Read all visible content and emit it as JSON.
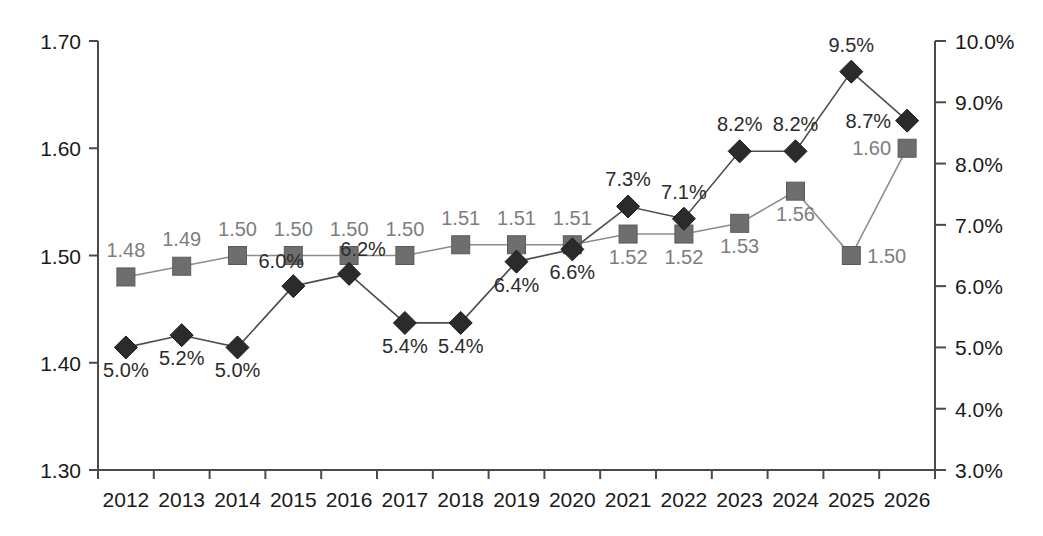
{
  "chart_data": {
    "type": "line",
    "title": "",
    "subtitle": "",
    "xlabel": "",
    "ylabel": "",
    "grid": false,
    "legend_position": "none",
    "categories": [
      "2012",
      "2013",
      "2014",
      "2015",
      "2016",
      "2017",
      "2018",
      "2019",
      "2020",
      "2021",
      "2022",
      "2023",
      "2024",
      "2025",
      "2026"
    ],
    "axes": {
      "left": {
        "ylim": [
          1.3,
          1.7
        ],
        "tick_step": 0.1,
        "tick_labels": [
          "1.70",
          "1.60",
          "1.50",
          "1.40",
          "1.30"
        ],
        "tick_values": [
          1.7,
          1.6,
          1.5,
          1.4,
          1.3
        ]
      },
      "right": {
        "ylim": [
          3.0,
          10.0
        ],
        "tick_step": 1.0,
        "tick_labels": [
          "10.0%",
          "9.0%",
          "8.0%",
          "7.0%",
          "6.0%",
          "5.0%",
          "4.0%",
          "3.0%"
        ],
        "tick_values": [
          10.0,
          9.0,
          8.0,
          7.0,
          6.0,
          5.0,
          4.0,
          3.0
        ]
      }
    },
    "series": [
      {
        "name": "value-series",
        "marker": "square",
        "axis": "left",
        "color": "#6e6e6e",
        "label_color": "#7d7d7d",
        "values": [
          1.48,
          1.49,
          1.5,
          1.5,
          1.5,
          1.5,
          1.51,
          1.51,
          1.51,
          1.52,
          1.52,
          1.53,
          1.56,
          1.5,
          1.6
        ],
        "labels": [
          "1.48",
          "1.49",
          "1.50",
          "1.50",
          "1.50",
          "1.50",
          "1.51",
          "1.51",
          "1.51",
          "1.52",
          "1.52",
          "1.53",
          "1.56",
          "1.50",
          "1.60"
        ],
        "label_positions": [
          "above",
          "above",
          "above",
          "above",
          "above",
          "above",
          "above",
          "above",
          "above",
          "below",
          "below",
          "below",
          "below",
          "right",
          "left"
        ]
      },
      {
        "name": "percent-series",
        "marker": "diamond",
        "axis": "right",
        "color": "#2b2b2b",
        "label_color": "#2b2b2b",
        "values": [
          5.0,
          5.2,
          5.0,
          6.0,
          6.2,
          5.4,
          5.4,
          6.4,
          6.6,
          7.3,
          7.1,
          8.2,
          8.2,
          9.5,
          8.7
        ],
        "labels": [
          "5.0%",
          "5.2%",
          "5.0%",
          "6.0%",
          "6.2%",
          "5.4%",
          "5.4%",
          "6.4%",
          "6.6%",
          "7.3%",
          "7.1%",
          "8.2%",
          "8.2%",
          "9.5%",
          "8.7%"
        ],
        "label_positions": [
          "below",
          "below",
          "below",
          "above-left",
          "above-right",
          "below",
          "below",
          "below",
          "below",
          "above",
          "above",
          "above",
          "above",
          "above",
          "left"
        ]
      }
    ]
  }
}
